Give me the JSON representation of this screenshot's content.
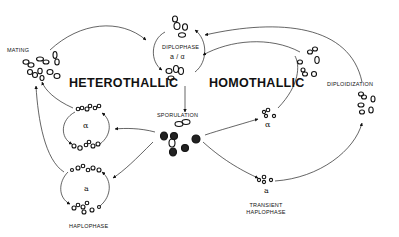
{
  "diagram": {
    "labels": {
      "mating": "MATING",
      "heterothallic": "HETEROTHALLIC",
      "homothallic": "HOMOTHALLIC",
      "diplophase": "DIPLOPHASE",
      "diplophase_type": "a / α",
      "sporulation": "SPORULATION",
      "diploidization": "DIPLOIDIZATION",
      "alpha_het": "α",
      "a_het": "a",
      "haplophase": "HAPLOPHASE",
      "alpha_homo": "α",
      "a_homo": "a",
      "transient_line1": "TRANSIENT",
      "transient_line2": "HAPLOPHASE"
    },
    "nodes": [
      {
        "id": "mating",
        "kind": "mating cells"
      },
      {
        "id": "diplophase",
        "kind": "diploid cells a/α"
      },
      {
        "id": "sporulation",
        "kind": "asci with spores"
      },
      {
        "id": "het-alpha",
        "kind": "haploid α cells"
      },
      {
        "id": "het-a",
        "kind": "haploid a cells"
      },
      {
        "id": "homo-alpha",
        "kind": "transient α cells"
      },
      {
        "id": "homo-a",
        "kind": "transient a cells"
      },
      {
        "id": "diploidization",
        "kind": "diploidizing cells"
      }
    ],
    "edges": [
      {
        "from": "mating",
        "to": "diplophase"
      },
      {
        "from": "diplophase",
        "to": "sporulation"
      },
      {
        "from": "sporulation",
        "to": "het-alpha"
      },
      {
        "from": "sporulation",
        "to": "het-a"
      },
      {
        "from": "het-alpha",
        "to": "mating"
      },
      {
        "from": "het-a",
        "to": "mating"
      },
      {
        "from": "sporulation",
        "to": "homo-alpha"
      },
      {
        "from": "sporulation",
        "to": "homo-a"
      },
      {
        "from": "homo-alpha",
        "to": "diplophase"
      },
      {
        "from": "homo-a",
        "to": "diploidization"
      },
      {
        "from": "diploidization",
        "to": "diplophase"
      }
    ]
  }
}
